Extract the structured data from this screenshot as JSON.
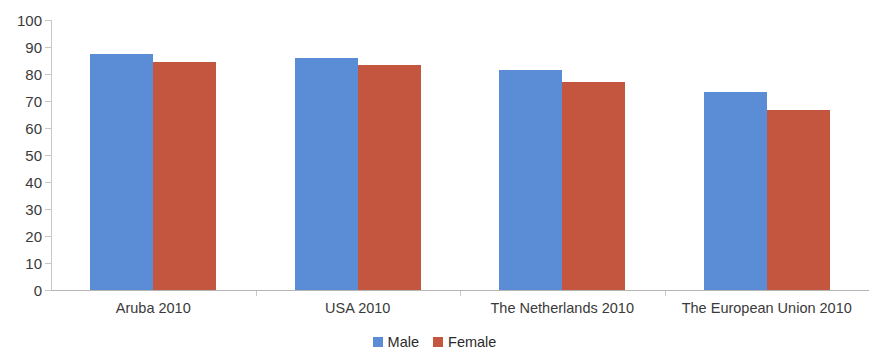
{
  "chart_data": {
    "type": "bar",
    "title": "",
    "subtitle": "",
    "xlabel": "",
    "ylabel": "",
    "categories": [
      "Aruba 2010",
      "USA 2010",
      "The Netherlands 2010",
      "The European Union 2010"
    ],
    "series": [
      {
        "name": "Male",
        "color": "#5b8dd6",
        "values": [
          87.4,
          86.0,
          81.5,
          73.3
        ]
      },
      {
        "name": "Female",
        "color": "#c4553f",
        "values": [
          84.5,
          83.5,
          77.0,
          66.7
        ]
      }
    ],
    "ylim": [
      0,
      100
    ],
    "ytick_labels": [
      "100",
      "90",
      "80",
      "70",
      "60",
      "50",
      "40",
      "30",
      "20",
      "10",
      "0"
    ],
    "ytick_values": [
      100,
      90,
      80,
      70,
      60,
      50,
      40,
      30,
      20,
      10,
      0
    ],
    "grid": false,
    "legend_position": "bottom",
    "legend_entries": [
      "Male",
      "Female"
    ]
  },
  "legend": {
    "male_label": "Male",
    "female_label": "Female"
  }
}
